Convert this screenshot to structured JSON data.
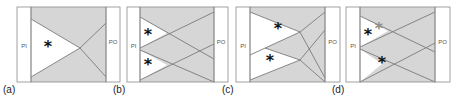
{
  "figure": {
    "colors": {
      "frame_stroke": "#8a8a8a",
      "shaded_fill": "#d6d6d6",
      "white_fill": "#ffffff",
      "line_stroke": "#7a7a7a",
      "asterisk_dark": "#111111",
      "asterisk_gray": "#8c8c8c",
      "strip_text": "#555555"
    },
    "panels": [
      {
        "id": "a",
        "label": "(a)",
        "pi_label": "PI",
        "po_label": "PO",
        "frame": {
          "x": 17,
          "y": 7,
          "w": 103,
          "h": 75
        },
        "pi_strip": {
          "x": 17,
          "w": 14
        },
        "po_strip": {
          "x": 106,
          "w": 14
        },
        "white_regions": [
          [
            [
              31,
              19
            ],
            [
              80,
              48
            ],
            [
              31,
              77
            ]
          ]
        ],
        "lines": [
          [
            [
              31,
              19
            ],
            [
              80,
              48
            ]
          ],
          [
            [
              31,
              77
            ],
            [
              80,
              48
            ]
          ],
          [
            [
              80,
              48
            ],
            [
              106,
              23
            ]
          ],
          [
            [
              80,
              48
            ],
            [
              106,
              77
            ]
          ]
        ],
        "asterisks": [
          {
            "x": 48,
            "y": 47,
            "tone": "dark"
          }
        ]
      },
      {
        "id": "b",
        "label": "(b)",
        "pi_label": "PI",
        "po_label": "PO",
        "frame": {
          "x": 127,
          "y": 7,
          "w": 101,
          "h": 75
        },
        "pi_strip": {
          "x": 127,
          "w": 13
        },
        "po_strip": {
          "x": 214,
          "w": 14
        },
        "white_regions": [
          [
            [
              140,
              17
            ],
            [
              167,
              33
            ],
            [
              140,
              48
            ]
          ],
          [
            [
              140,
              50
            ],
            [
              167,
              65
            ],
            [
              140,
              80
            ]
          ]
        ],
        "lines": [
          [
            [
              140,
              17
            ],
            [
              214,
              59
            ]
          ],
          [
            [
              140,
              48
            ],
            [
              214,
              12
            ]
          ],
          [
            [
              140,
              50
            ],
            [
              214,
              82
            ]
          ],
          [
            [
              140,
              80
            ],
            [
              214,
              44
            ]
          ]
        ],
        "asterisks": [
          {
            "x": 148,
            "y": 35,
            "tone": "dark"
          },
          {
            "x": 148,
            "y": 65,
            "tone": "dark"
          }
        ]
      },
      {
        "id": "c",
        "label": "(c)",
        "pi_label": "PI",
        "po_label": "PO",
        "frame": {
          "x": 236,
          "y": 7,
          "w": 104,
          "h": 75
        },
        "pi_strip": {
          "x": 236,
          "w": 14
        },
        "po_strip": {
          "x": 325,
          "w": 15
        },
        "white_regions": [
          [
            [
              250,
              12
            ],
            [
              300,
              32
            ],
            [
              265,
              48
            ],
            [
              250,
              55
            ]
          ],
          [
            [
              250,
              55
            ],
            [
              265,
              48
            ],
            [
              300,
              60
            ],
            [
              250,
              80
            ]
          ]
        ],
        "lines": [
          [
            [
              250,
              12
            ],
            [
              300,
              32
            ]
          ],
          [
            [
              250,
              55
            ],
            [
              300,
              32
            ]
          ],
          [
            [
              265,
              48
            ],
            [
              300,
              60
            ]
          ],
          [
            [
              250,
              80
            ],
            [
              300,
              60
            ]
          ],
          [
            [
              300,
              32
            ],
            [
              325,
              12
            ]
          ],
          [
            [
              300,
              32
            ],
            [
              325,
              78
            ]
          ],
          [
            [
              300,
              60
            ],
            [
              325,
              30
            ]
          ],
          [
            [
              300,
              60
            ],
            [
              325,
              82
            ]
          ]
        ],
        "asterisks": [
          {
            "x": 278,
            "y": 29,
            "tone": "dark"
          },
          {
            "x": 270,
            "y": 61,
            "tone": "dark"
          }
        ]
      },
      {
        "id": "d",
        "label": "(d)",
        "pi_label": "PI",
        "po_label": "PO",
        "frame": {
          "x": 346,
          "y": 7,
          "w": 104,
          "h": 75
        },
        "pi_strip": {
          "x": 346,
          "w": 14
        },
        "po_strip": {
          "x": 435,
          "w": 15
        },
        "white_regions": [
          [
            [
              360,
              16
            ],
            [
              388,
              31
            ],
            [
              360,
              47
            ]
          ],
          [
            [
              360,
              49
            ],
            [
              382,
              64
            ],
            [
              360,
              82
            ]
          ]
        ],
        "lines": [
          [
            [
              360,
              16
            ],
            [
              435,
              52
            ]
          ],
          [
            [
              360,
              47
            ],
            [
              435,
              12
            ]
          ],
          [
            [
              360,
              49
            ],
            [
              435,
              82
            ]
          ],
          [
            [
              360,
              82
            ],
            [
              435,
              43
            ]
          ]
        ],
        "asterisks": [
          {
            "x": 368,
            "y": 35,
            "tone": "dark"
          },
          {
            "x": 379,
            "y": 29,
            "tone": "gray"
          },
          {
            "x": 382,
            "y": 63,
            "tone": "dark"
          }
        ]
      }
    ]
  }
}
